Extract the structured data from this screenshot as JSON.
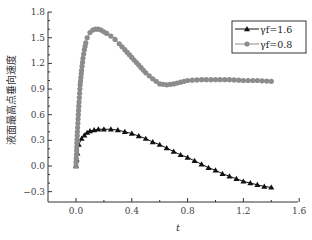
{
  "chart_data": {
    "type": "line",
    "title": "",
    "xlabel": "t",
    "ylabel": "液面最高点垂向速度",
    "xlim": [
      -0.2,
      1.6
    ],
    "ylim": [
      -0.4,
      1.8
    ],
    "xticks": [
      "0.0",
      "0.4",
      "0.8",
      "1.2",
      "1.6"
    ],
    "yticks": [
      "-0.3",
      "0.0",
      "0.3",
      "0.6",
      "0.9",
      "1.2",
      "1.5",
      "1.8"
    ],
    "grid": false,
    "legend_position": "upper right",
    "series": [
      {
        "name": "γf=1.6",
        "marker": "triangle",
        "color": "#111111",
        "x": [
          0.0,
          0.01,
          0.02,
          0.04,
          0.06,
          0.08,
          0.1,
          0.13,
          0.16,
          0.2,
          0.25,
          0.3,
          0.35,
          0.4,
          0.45,
          0.5,
          0.55,
          0.6,
          0.65,
          0.7,
          0.75,
          0.8,
          0.85,
          0.9,
          0.95,
          1.0,
          1.05,
          1.1,
          1.15,
          1.2,
          1.25,
          1.3,
          1.35,
          1.4
        ],
        "y": [
          0.0,
          0.15,
          0.25,
          0.32,
          0.36,
          0.39,
          0.41,
          0.42,
          0.43,
          0.43,
          0.43,
          0.42,
          0.4,
          0.38,
          0.35,
          0.32,
          0.28,
          0.25,
          0.21,
          0.17,
          0.13,
          0.1,
          0.06,
          0.02,
          -0.02,
          -0.05,
          -0.09,
          -0.12,
          -0.15,
          -0.18,
          -0.2,
          -0.22,
          -0.24,
          -0.25
        ]
      },
      {
        "name": "γf=0.8",
        "marker": "circle",
        "color": "#8c8c8c",
        "x": [
          0.0,
          0.01,
          0.02,
          0.03,
          0.04,
          0.05,
          0.06,
          0.07,
          0.08,
          0.1,
          0.12,
          0.14,
          0.16,
          0.18,
          0.2,
          0.22,
          0.25,
          0.28,
          0.31,
          0.35,
          0.4,
          0.45,
          0.5,
          0.55,
          0.6,
          0.65,
          0.7,
          0.75,
          0.8,
          0.9,
          1.0,
          1.1,
          1.2,
          1.3,
          1.4
        ],
        "y": [
          0.0,
          0.4,
          0.7,
          0.95,
          1.12,
          1.26,
          1.36,
          1.44,
          1.5,
          1.56,
          1.59,
          1.6,
          1.6,
          1.59,
          1.57,
          1.55,
          1.52,
          1.48,
          1.43,
          1.36,
          1.27,
          1.18,
          1.09,
          1.02,
          0.96,
          0.95,
          0.96,
          0.98,
          1.0,
          1.01,
          1.01,
          1.01,
          1.0,
          1.0,
          0.99
        ]
      }
    ]
  },
  "legend": {
    "items": [
      {
        "label": "γf=1.6",
        "marker": "triangle"
      },
      {
        "label": "γf=0.8",
        "marker": "circle"
      }
    ]
  }
}
